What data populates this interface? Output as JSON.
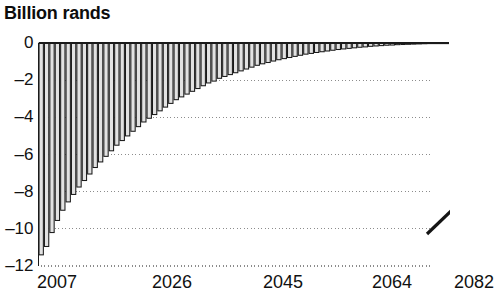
{
  "chart_data": {
    "type": "bar",
    "title": "Billion rands",
    "subtitle": "",
    "xlabel": "",
    "ylabel": "",
    "ylim": [
      -12,
      0
    ],
    "xlim": [
      2007,
      2082
    ],
    "grid": true,
    "grid_values": [
      -2,
      -4,
      -6,
      -8,
      -10,
      -12
    ],
    "legend": null,
    "ytick_labels": [
      "0",
      "–2",
      "–4",
      "–6",
      "–8",
      "–10",
      "–12"
    ],
    "ytick_values": [
      0,
      -2,
      -4,
      -6,
      -8,
      -10,
      -12
    ],
    "xtick_labels": [
      "2007",
      "2026",
      "2045",
      "2064",
      "2082"
    ],
    "xtick_values": [
      2007,
      2026,
      2045,
      2064,
      2082
    ],
    "categories": [
      "2007",
      "2008",
      "2009",
      "2010",
      "2011",
      "2012",
      "2013",
      "2014",
      "2015",
      "2016",
      "2017",
      "2018",
      "2019",
      "2020",
      "2021",
      "2022",
      "2023",
      "2024",
      "2025",
      "2026",
      "2027",
      "2028",
      "2029",
      "2030",
      "2031",
      "2032",
      "2033",
      "2034",
      "2035",
      "2036",
      "2037",
      "2038",
      "2039",
      "2040",
      "2041",
      "2042",
      "2043",
      "2044",
      "2045",
      "2046",
      "2047",
      "2048",
      "2049",
      "2050",
      "2051",
      "2052",
      "2053",
      "2054",
      "2055",
      "2056",
      "2057",
      "2058",
      "2059",
      "2060",
      "2061",
      "2062",
      "2063",
      "2064",
      "2065",
      "2066",
      "2067",
      "2068",
      "2069",
      "2070",
      "2071",
      "2072",
      "2073",
      "2074",
      "2075",
      "2076",
      "2077",
      "2078",
      "2079",
      "2080",
      "2081",
      "2082"
    ],
    "values": [
      -11.4,
      -10.95,
      -10.2,
      -9.55,
      -9.0,
      -8.55,
      -8.15,
      -7.75,
      -7.4,
      -7.05,
      -6.7,
      -6.4,
      -6.1,
      -5.8,
      -5.5,
      -5.25,
      -5.0,
      -4.75,
      -4.5,
      -4.25,
      -4.05,
      -3.85,
      -3.65,
      -3.45,
      -3.25,
      -3.05,
      -2.9,
      -2.75,
      -2.6,
      -2.45,
      -2.3,
      -2.15,
      -2.05,
      -1.9,
      -1.8,
      -1.7,
      -1.6,
      -1.5,
      -1.4,
      -1.3,
      -1.2,
      -1.12,
      -1.05,
      -0.97,
      -0.9,
      -0.84,
      -0.78,
      -0.72,
      -0.66,
      -0.6,
      -0.56,
      -0.51,
      -0.47,
      -0.43,
      -0.39,
      -0.35,
      -0.32,
      -0.29,
      -0.26,
      -0.23,
      -0.21,
      -0.18,
      -0.16,
      -0.14,
      -0.12,
      -0.11,
      -0.09,
      -0.08,
      -0.07,
      -0.06,
      -0.05,
      -0.04,
      -0.03,
      -0.03,
      -0.02,
      -0.02
    ],
    "bar_fill_color": "#e2e2e2",
    "bar_edge_color": "#1a1a1a",
    "axis_color": "#1a1a1a",
    "grid_color": "#8c8c8c",
    "background_color": "#ffffff"
  },
  "annotations": {
    "clipped_diagonal_line": {
      "description": "partial diagonal stroke clipped at right edge",
      "color": "#141414"
    }
  }
}
